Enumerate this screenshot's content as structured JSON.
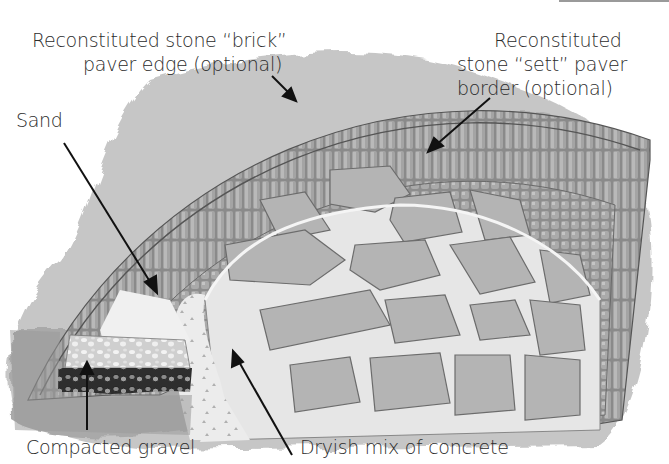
{
  "figure": {
    "colors": {
      "background": "#ffffff",
      "wash": "#a9a9a9",
      "brick": "#8c8c8c",
      "sett": "#9e9e9e",
      "flagstone": "#b7b7b7",
      "joint": "#e9e9e9",
      "gravel_dark": "#3a3a3a",
      "arrow": "#111111"
    }
  },
  "labels": {
    "brick_edge": {
      "lines": [
        "Reconstituted stone “brick”",
        "paver edge (optional)"
      ]
    },
    "sett_border": {
      "lines": [
        "Reconstituted",
        "stone “sett” paver",
        "border (optional)"
      ]
    },
    "sand": {
      "lines": [
        "Sand"
      ]
    },
    "gravel": {
      "lines": [
        "Compacted gravel"
      ]
    },
    "concrete": {
      "lines": [
        "Dryish mix of concrete"
      ]
    }
  }
}
